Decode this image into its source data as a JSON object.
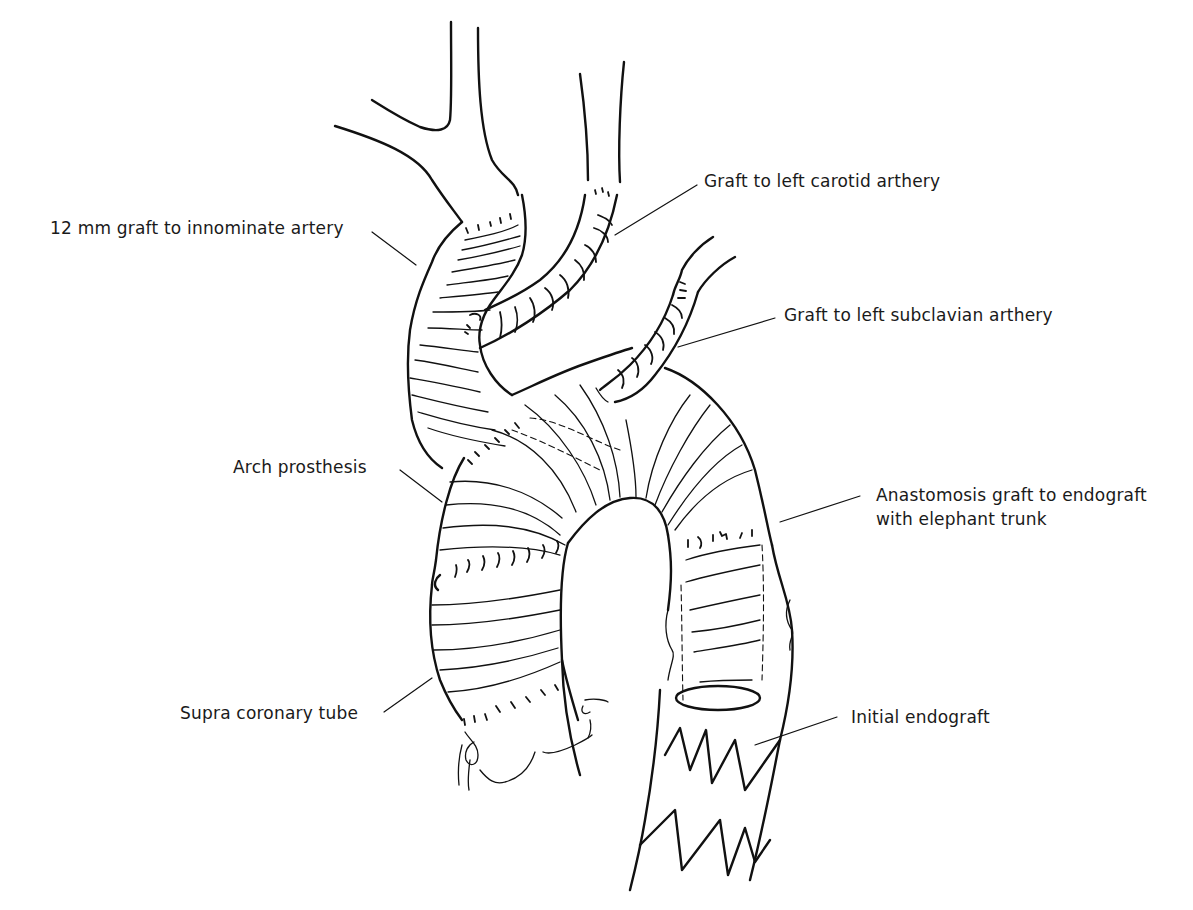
{
  "figure": {
    "type": "surgical illustration",
    "background": "#ffffff",
    "line_color": "#111111"
  },
  "labels": {
    "innominate": "12 mm graft to innominate artery",
    "carotid": "Graft to left carotid arthery",
    "subclavian": "Graft to left subclavian arthery",
    "arch": "Arch prosthesis",
    "anastomosis_line1": "Anastomosis graft to endograft",
    "anastomosis_line2": "with elephant trunk",
    "supra": "Supra coronary tube",
    "endograft": "Initial endograft"
  }
}
